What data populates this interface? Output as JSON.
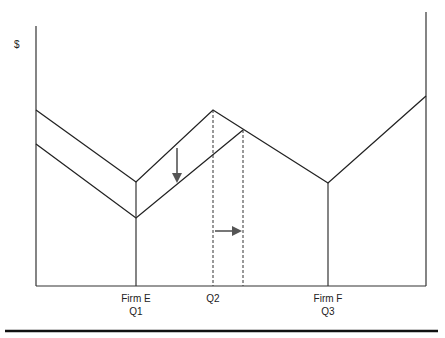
{
  "diagram": {
    "y_axis_label": "$",
    "x_labels": [
      {
        "line1": "Firm E",
        "line2": "Q1",
        "x": 136
      },
      {
        "line1": "Q2",
        "line2": "",
        "x": 213
      },
      {
        "line1": "Firm F",
        "line2": "Q3",
        "x": 328
      }
    ],
    "colors": {
      "line": "#222222",
      "arrow": "#555555",
      "rule": "#111111"
    },
    "annotations": [
      "down-arrow: upper curve shifts down",
      "right-arrow: Q2 shifts right"
    ]
  }
}
